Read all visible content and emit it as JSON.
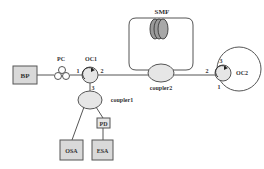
{
  "diagram": {
    "type": "fiber-optic-setup",
    "components": {
      "bp": {
        "label": "BP"
      },
      "pc": {
        "label": "PC"
      },
      "oc1": {
        "label": "OC1",
        "ports": [
          "1",
          "2",
          "3"
        ]
      },
      "smf": {
        "label": "SMF"
      },
      "coupler2": {
        "label": "coupler2"
      },
      "oc2": {
        "label": "OC2",
        "ports": [
          "2",
          "3",
          "1"
        ]
      },
      "coupler1": {
        "label": "coupler1"
      },
      "pd": {
        "label": "PD"
      },
      "osa": {
        "label": "OSA"
      },
      "esa": {
        "label": "ESA"
      }
    },
    "colors": {
      "line": "#555555",
      "box_fill": "#d9d9d9",
      "ellipse_fill": "#e6e6e6",
      "coil_fill": "#9a9a9a"
    }
  }
}
